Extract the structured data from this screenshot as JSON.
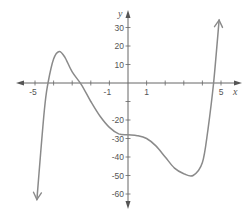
{
  "chart_data": {
    "type": "line",
    "title": "",
    "xlabel": "x",
    "ylabel": "y",
    "xlim": [
      -5.5,
      5.5
    ],
    "ylim": [
      -68,
      38
    ],
    "grid": false,
    "legend": null,
    "x_tick_labels": [
      "-5",
      "-1",
      "1",
      "5"
    ],
    "x_ticks": [
      -5,
      -4,
      -3,
      -2,
      -1,
      1,
      2,
      3,
      4,
      5
    ],
    "y_tick_labels": [
      "30",
      "20",
      "10",
      "-20",
      "-30",
      "-40",
      "-50",
      "-60"
    ],
    "y_ticks": [
      30,
      20,
      10,
      -10,
      -20,
      -30,
      -40,
      -50,
      -60
    ],
    "series": [
      {
        "name": "polynomial curve",
        "color": "#8a8a8a",
        "arrows": [
          "down-left end",
          "up-right end"
        ],
        "x": [
          -4.9,
          -4.5,
          -4.3,
          -4.0,
          -3.7,
          -3.4,
          -3.0,
          -2.5,
          -2.0,
          -1.5,
          -1.0,
          -0.5,
          0,
          0.5,
          1.0,
          1.5,
          2.0,
          2.5,
          3.0,
          3.5,
          4.0,
          4.3,
          4.6,
          4.9
        ],
        "y": [
          -63,
          -15,
          0,
          13,
          17,
          14,
          6,
          -1,
          -10,
          -18,
          -24,
          -27.5,
          -28,
          -28.5,
          -30,
          -34,
          -40,
          -46,
          -49,
          -50,
          -43,
          -25,
          0,
          34
        ]
      }
    ],
    "key_points": {
      "local_max": [
        -3.7,
        17
      ],
      "local_min": [
        3.5,
        -50
      ],
      "inflection_flat": [
        0,
        -28
      ],
      "x_intercepts": [
        -4.3,
        -2.5,
        4.6
      ]
    }
  }
}
